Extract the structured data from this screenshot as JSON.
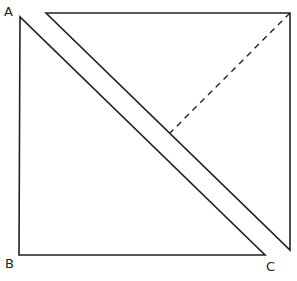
{
  "diagram": {
    "stroke_color": "#222222",
    "background": "#ffffff",
    "lower_triangle": {
      "vertices": {
        "A": [
          20,
          17
        ],
        "B": [
          19,
          255
        ],
        "C": [
          265,
          255
        ]
      },
      "labels": {
        "A": "A",
        "B": "B",
        "C": "C"
      }
    },
    "upper_triangle": {
      "vertices": {
        "top_left": [
          46,
          13
        ],
        "top_right": [
          290,
          13
        ],
        "bottom_right": [
          290,
          250
        ]
      }
    },
    "dashed_altitude": {
      "from": [
        290,
        13
      ],
      "to": [
        170,
        133
      ],
      "style": "dashed"
    }
  }
}
